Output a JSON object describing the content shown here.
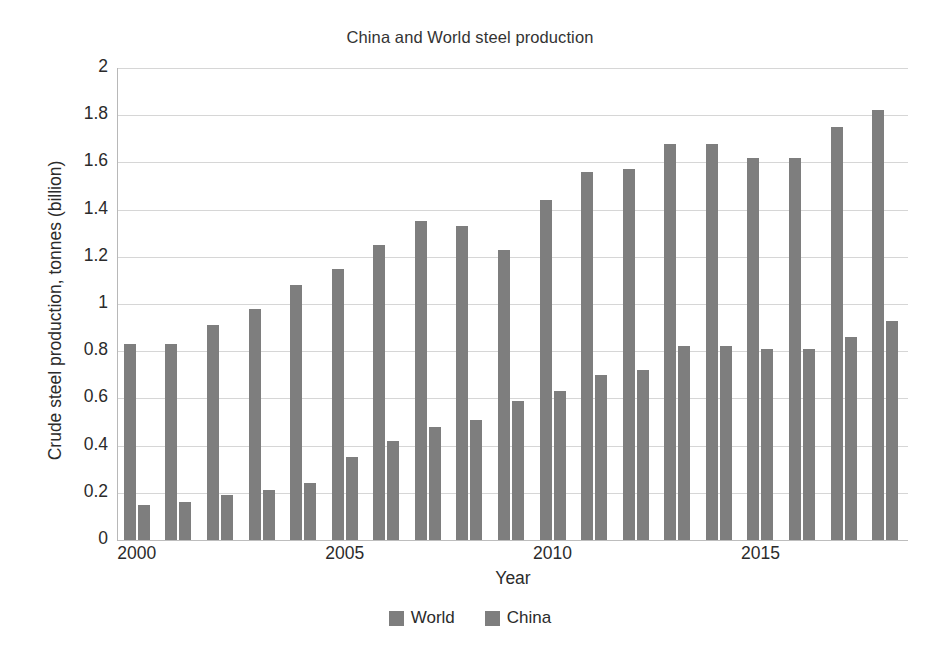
{
  "chart_data": {
    "type": "bar",
    "title": "China and World steel production",
    "xlabel": "Year",
    "ylabel": "Crude steel production, tonnes (billion)",
    "categories": [
      2000,
      2001,
      2002,
      2003,
      2004,
      2005,
      2006,
      2007,
      2008,
      2009,
      2010,
      2011,
      2012,
      2013,
      2014,
      2015,
      2016,
      2017,
      2018
    ],
    "series": [
      {
        "name": "World",
        "color": "#7e7e7e",
        "values": [
          0.83,
          0.83,
          0.91,
          0.98,
          1.08,
          1.15,
          1.25,
          1.35,
          1.33,
          1.23,
          1.44,
          1.56,
          1.57,
          1.68,
          1.68,
          1.62,
          1.62,
          1.75,
          1.82
        ]
      },
      {
        "name": "China",
        "color": "#7e7e7e",
        "values": [
          0.15,
          0.16,
          0.19,
          0.21,
          0.24,
          0.35,
          0.42,
          0.48,
          0.51,
          0.59,
          0.63,
          0.7,
          0.72,
          0.82,
          0.82,
          0.81,
          0.81,
          0.86,
          0.93
        ]
      }
    ],
    "ylim": [
      0,
      2
    ],
    "ytick_labels": [
      "0",
      "0.2",
      "0.4",
      "0.6",
      "0.8",
      "1",
      "1.2",
      "1.4",
      "1.6",
      "1.8",
      "2"
    ],
    "ytick_values": [
      0,
      0.2,
      0.4,
      0.6,
      0.8,
      1,
      1.2,
      1.4,
      1.6,
      1.8,
      2
    ],
    "xtick_labels": [
      "2000",
      "2005",
      "2010",
      "2015"
    ],
    "xtick_values": [
      2000,
      2005,
      2010,
      2015
    ],
    "grid": "horizontal",
    "legend_position": "bottom",
    "legend_entries": [
      "World",
      "China"
    ]
  },
  "caption": {
    "partial_text": ""
  }
}
